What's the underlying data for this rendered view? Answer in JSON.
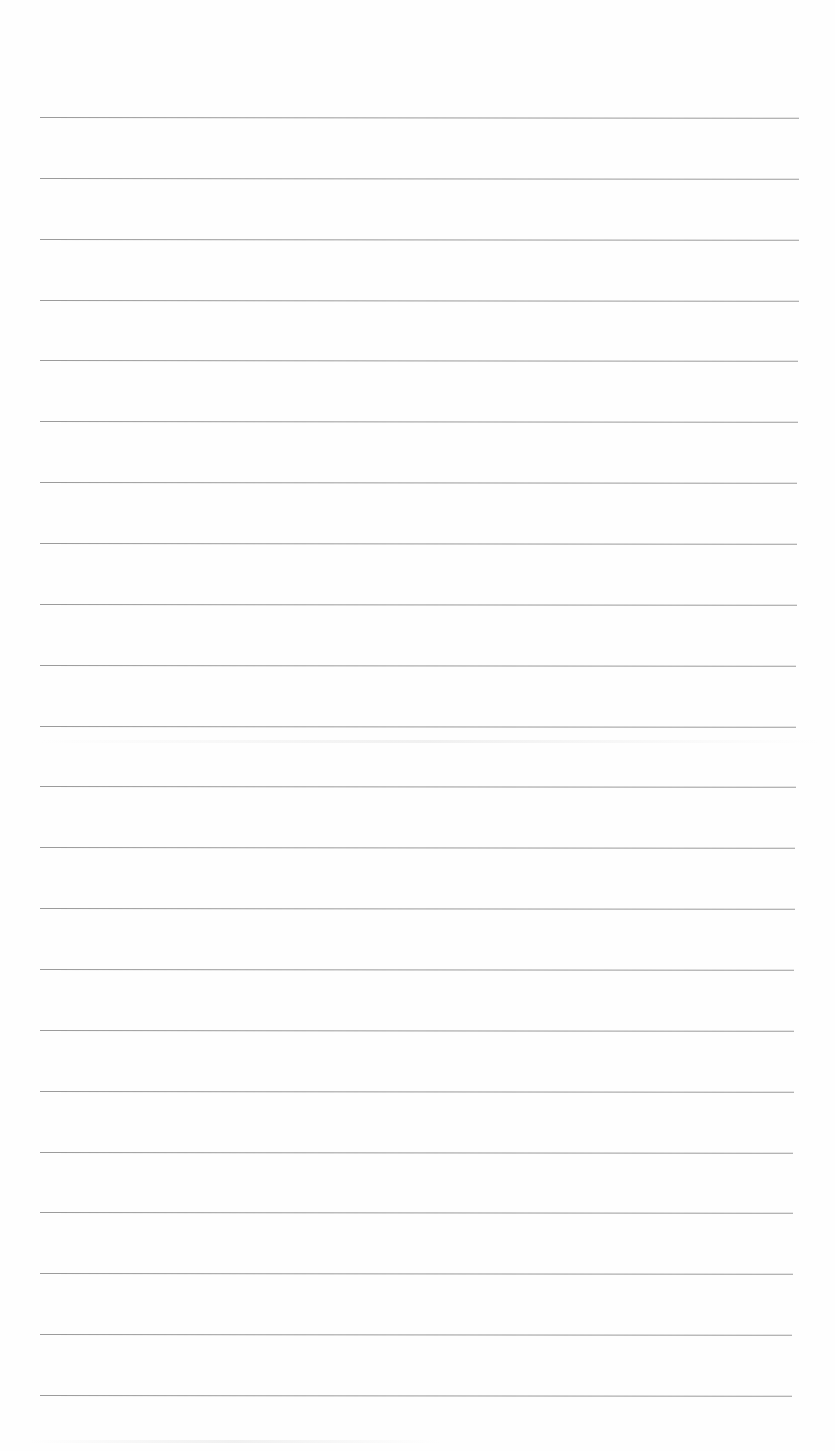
{
  "document": {
    "type": "lined-paper",
    "background_color": "#fefefe",
    "rule_color": "#8a8a8a",
    "rule_count": 22,
    "rules": [
      {
        "y": 117,
        "x1": 40,
        "x2": 799
      },
      {
        "y": 172,
        "x1": 40,
        "x2": 799
      },
      {
        "y": 228,
        "x1": 40,
        "x2": 799
      },
      {
        "y": 283,
        "x1": 40,
        "x2": 799
      },
      {
        "y": 340,
        "x1": 40,
        "x2": 798
      },
      {
        "y": 396,
        "x1": 40,
        "x2": 798
      },
      {
        "y": 451,
        "x1": 40,
        "x2": 797
      },
      {
        "y": 507,
        "x1": 40,
        "x2": 797
      },
      {
        "y": 564,
        "x1": 40,
        "x2": 797
      },
      {
        "y": 621,
        "x1": 40,
        "x2": 796
      },
      {
        "y": 677,
        "x1": 40,
        "x2": 796
      },
      {
        "y": 734,
        "x1": 40,
        "x2": 796
      },
      {
        "y": 789,
        "x1": 40,
        "x2": 795
      },
      {
        "y": 846,
        "x1": 40,
        "x2": 795
      },
      {
        "y": 903,
        "x1": 40,
        "x2": 794
      },
      {
        "y": 959,
        "x1": 40,
        "x2": 794
      },
      {
        "y": 1015,
        "x1": 40,
        "x2": 794
      },
      {
        "y": 1072,
        "x1": 40,
        "x2": 793
      },
      {
        "y": 1128,
        "x1": 40,
        "x2": 793
      },
      {
        "y": 1184,
        "x1": 40,
        "x2": 793
      },
      {
        "y": 1241,
        "x1": 40,
        "x2": 792
      },
      {
        "y": 1297,
        "x1": 40,
        "x2": 792
      }
    ],
    "smudges": [
      {
        "y": 740,
        "x1": 40,
        "x2": 820
      },
      {
        "y": 1440,
        "x1": 30,
        "x2": 440
      }
    ]
  }
}
